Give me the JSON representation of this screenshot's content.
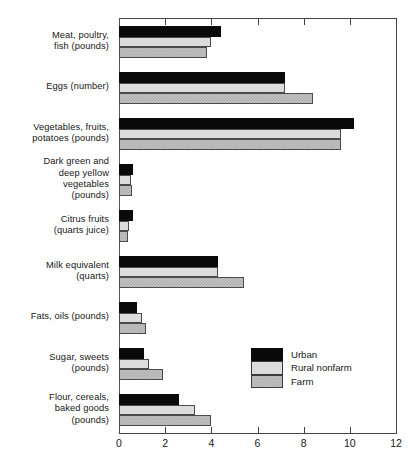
{
  "chart_data": {
    "type": "bar",
    "orientation": "horizontal",
    "title": "",
    "subtitle": "",
    "xlabel": "",
    "ylabel": "",
    "xlim": [
      0,
      12
    ],
    "xticks": [
      0,
      2,
      4,
      6,
      8,
      10,
      12
    ],
    "xtick_labels": [
      "0",
      "2",
      "4",
      "6",
      "8",
      "10",
      "12"
    ],
    "grid": false,
    "legend_position": "inside-right-lower",
    "categories": [
      "Meat, poultry,\nfish (pounds)",
      "Eggs (number)",
      "Vegetables, fruits,\npotatoes (pounds)",
      "Dark green and\ndeep yellow\nvegetables\n(pounds)",
      "Citrus fruits\n(quarts juice)",
      "Milk equivalent\n(quarts)",
      "Fats, oils (pounds)",
      "Sugar, sweets\n(pounds)",
      "Flour, cereals,\nbaked goods\n(pounds)"
    ],
    "series": [
      {
        "name": "Urban",
        "color": "#0a0a0a",
        "fill": "solid-black",
        "values": [
          4.4,
          7.2,
          10.2,
          0.6,
          0.6,
          4.3,
          0.8,
          1.1,
          2.6
        ]
      },
      {
        "name": "Rural nonfarm",
        "color": "#dcdcdc",
        "fill": "light-gray",
        "values": [
          4.0,
          7.2,
          9.6,
          0.5,
          0.45,
          4.3,
          1.0,
          1.3,
          3.3
        ]
      },
      {
        "name": "Farm",
        "color": "#c3c3c3",
        "fill": "gray-checkered",
        "values": [
          3.8,
          8.4,
          9.6,
          0.55,
          0.4,
          5.4,
          1.15,
          1.9,
          4.0
        ]
      }
    ]
  },
  "legend": {
    "entries": [
      {
        "label": "Urban"
      },
      {
        "label": "Rural nonfarm"
      },
      {
        "label": "Farm"
      }
    ]
  }
}
